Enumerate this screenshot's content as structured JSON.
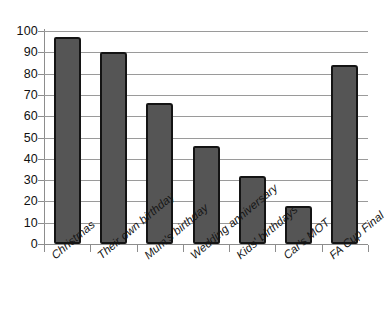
{
  "chart_data": {
    "type": "bar",
    "title": "",
    "subtitle": "",
    "xlabel": "",
    "ylabel": "",
    "ylim": [
      0,
      100
    ],
    "ytick_step": 10,
    "yticks": [
      100,
      90,
      80,
      70,
      60,
      50,
      40,
      30,
      20,
      10,
      0
    ],
    "grid": true,
    "legend": false,
    "legend_position": "none",
    "categories": [
      "Christmas",
      "Their own birthday",
      "Mum's birthday",
      "Wedding anniversary",
      "Kids' birthdays",
      "Car's MOT",
      "FA Cup Final"
    ],
    "values": [
      97,
      90,
      66,
      46,
      32,
      18,
      84
    ],
    "bar_fill_color": "#555555",
    "bar_outline_color": "#141414",
    "gridline_color": "#9a9a9a",
    "axis_color": "#8d8d8d",
    "background_color": "#ffffff"
  }
}
